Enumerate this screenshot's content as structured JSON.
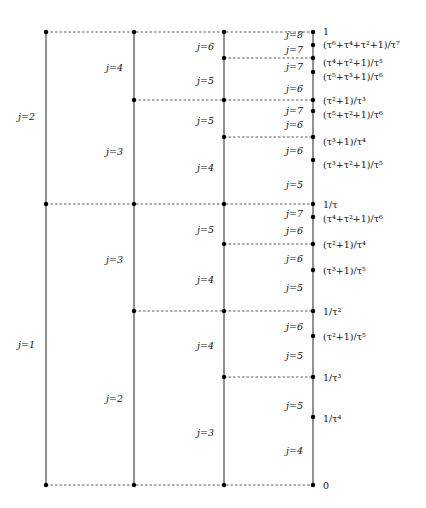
{
  "columns_x": [
    46,
    134,
    224,
    313
  ],
  "vertical_lines": [
    {
      "x": 46,
      "y1": 32,
      "y2": 485
    },
    {
      "x": 134,
      "y1": 32,
      "y2": 485
    },
    {
      "x": 224,
      "y1": 32,
      "y2": 485
    },
    {
      "x": 313,
      "y1": 32,
      "y2": 485
    }
  ],
  "dashed_lines": [
    {
      "x1": 46,
      "x2": 313,
      "y": 32
    },
    {
      "x1": 224,
      "x2": 313,
      "y": 58
    },
    {
      "x1": 134,
      "x2": 313,
      "y": 100
    },
    {
      "x1": 224,
      "x2": 313,
      "y": 137
    },
    {
      "x1": 46,
      "x2": 313,
      "y": 204
    },
    {
      "x1": 224,
      "x2": 313,
      "y": 244
    },
    {
      "x1": 134,
      "x2": 313,
      "y": 311
    },
    {
      "x1": 224,
      "x2": 313,
      "y": 377
    },
    {
      "x1": 46,
      "x2": 313,
      "y": 485
    }
  ],
  "dots": [
    [
      46,
      32
    ],
    [
      134,
      32
    ],
    [
      224,
      32
    ],
    [
      313,
      32
    ],
    [
      224,
      58
    ],
    [
      313,
      58
    ],
    [
      134,
      100
    ],
    [
      224,
      100
    ],
    [
      313,
      100
    ],
    [
      224,
      137
    ],
    [
      313,
      137
    ],
    [
      46,
      204
    ],
    [
      134,
      204
    ],
    [
      224,
      204
    ],
    [
      313,
      204
    ],
    [
      224,
      244
    ],
    [
      313,
      244
    ],
    [
      134,
      311
    ],
    [
      224,
      311
    ],
    [
      313,
      311
    ],
    [
      224,
      377
    ],
    [
      313,
      377
    ],
    [
      46,
      485
    ],
    [
      134,
      485
    ],
    [
      224,
      485
    ],
    [
      313,
      485
    ],
    [
      313,
      45
    ],
    [
      313,
      72
    ],
    [
      313,
      111
    ],
    [
      313,
      160
    ],
    [
      313,
      217
    ],
    [
      313,
      270
    ],
    [
      313,
      336
    ],
    [
      313,
      417
    ]
  ],
  "col1_labels": [
    {
      "text": "j=2",
      "x": 18,
      "y": 112
    },
    {
      "text": "j=1",
      "x": 18,
      "y": 340
    }
  ],
  "col2_labels": [
    {
      "text": "j=4",
      "x": 106,
      "y": 63
    },
    {
      "text": "j=3",
      "x": 106,
      "y": 147
    },
    {
      "text": "j=3",
      "x": 106,
      "y": 255
    },
    {
      "text": "j=2",
      "x": 106,
      "y": 394
    }
  ],
  "col3_labels": [
    {
      "text": "j=6",
      "x": 197,
      "y": 42
    },
    {
      "text": "j=5",
      "x": 197,
      "y": 76
    },
    {
      "text": "j=5",
      "x": 197,
      "y": 116
    },
    {
      "text": "j=4",
      "x": 197,
      "y": 163
    },
    {
      "text": "j=5",
      "x": 197,
      "y": 225
    },
    {
      "text": "j=4",
      "x": 197,
      "y": 275
    },
    {
      "text": "j=4",
      "x": 197,
      "y": 341
    },
    {
      "text": "j=3",
      "x": 197,
      "y": 428
    }
  ],
  "col4_labels": [
    {
      "text": "j=8",
      "x": 286,
      "y": 30
    },
    {
      "text": "j=7",
      "x": 286,
      "y": 45
    },
    {
      "text": "j=7",
      "x": 286,
      "y": 62
    },
    {
      "text": "j=6",
      "x": 286,
      "y": 84
    },
    {
      "text": "j=7",
      "x": 286,
      "y": 106
    },
    {
      "text": "j=6",
      "x": 286,
      "y": 120
    },
    {
      "text": "j=6",
      "x": 286,
      "y": 146
    },
    {
      "text": "j=5",
      "x": 286,
      "y": 180
    },
    {
      "text": "j=7",
      "x": 286,
      "y": 209
    },
    {
      "text": "j=6",
      "x": 286,
      "y": 226
    },
    {
      "text": "j=6",
      "x": 286,
      "y": 254
    },
    {
      "text": "j=5",
      "x": 286,
      "y": 283
    },
    {
      "text": "j=6",
      "x": 286,
      "y": 322
    },
    {
      "text": "j=5",
      "x": 286,
      "y": 351
    },
    {
      "text": "j=5",
      "x": 286,
      "y": 401
    },
    {
      "text": "j=4",
      "x": 286,
      "y": 446
    }
  ],
  "value_labels": [
    {
      "text": "1",
      "x": 323,
      "y": 27
    },
    {
      "text": "(τ⁶+τ⁴+τ²+1)/τ⁷",
      "x": 323,
      "y": 40
    },
    {
      "text": "(τ⁴+τ²+1)/τ⁵",
      "x": 323,
      "y": 58
    },
    {
      "text": "(τ⁵+τ³+1)/τ⁶",
      "x": 323,
      "y": 72
    },
    {
      "text": "(τ²+1)/τ³",
      "x": 323,
      "y": 96
    },
    {
      "text": "(τ⁵+τ²+1)/τ⁶",
      "x": 323,
      "y": 110
    },
    {
      "text": "(τ³+1)/τ⁴",
      "x": 323,
      "y": 137
    },
    {
      "text": "(τ³+τ²+1)/τ⁵",
      "x": 323,
      "y": 160
    },
    {
      "text": "1/τ",
      "x": 323,
      "y": 200
    },
    {
      "text": "(τ⁴+τ²+1)/τ⁶",
      "x": 323,
      "y": 214
    },
    {
      "text": "(τ²+1)/τ⁴",
      "x": 323,
      "y": 240
    },
    {
      "text": "(τ³+1)/τ⁵",
      "x": 323,
      "y": 266
    },
    {
      "text": "1/τ²",
      "x": 323,
      "y": 307
    },
    {
      "text": "(τ²+1)/τ⁵",
      "x": 323,
      "y": 332
    },
    {
      "text": "1/τ³",
      "x": 323,
      "y": 373
    },
    {
      "text": "1/τ⁴",
      "x": 323,
      "y": 414
    },
    {
      "text": "0",
      "x": 323,
      "y": 481
    }
  ]
}
